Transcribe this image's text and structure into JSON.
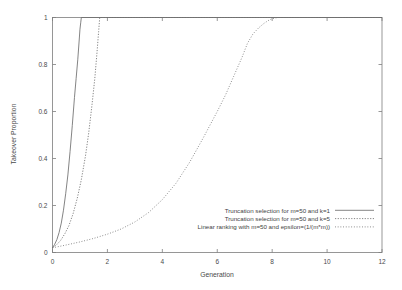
{
  "chart_data": {
    "type": "line",
    "title": "",
    "xlabel": "Generation",
    "ylabel": "Takeover Proportion",
    "xlim": [
      0,
      12
    ],
    "ylim": [
      0,
      1
    ],
    "xticks": [
      0,
      2,
      4,
      6,
      8,
      10,
      12
    ],
    "xtick_labels": [
      "0",
      "2",
      "4",
      "6",
      "8",
      "10",
      "12"
    ],
    "yticks": [
      0,
      0.2,
      0.4,
      0.6,
      0.8,
      1
    ],
    "ytick_labels": [
      "0",
      "0.2",
      "0.4",
      "0.6",
      "0.8",
      "1"
    ],
    "grid": false,
    "legend_position": "lower right",
    "series": [
      {
        "name": "Truncation selection for m=50 and k=1",
        "style": "solid",
        "color": "#6e6e6e",
        "x": [
          0,
          0.08,
          0.16,
          0.24,
          0.32,
          0.4,
          0.48,
          0.56,
          0.64,
          0.72,
          0.8,
          0.86,
          0.92,
          0.97,
          1.0,
          1.03,
          1.05,
          12
        ],
        "y": [
          0.02,
          0.035,
          0.055,
          0.085,
          0.125,
          0.18,
          0.25,
          0.33,
          0.43,
          0.54,
          0.66,
          0.74,
          0.82,
          0.9,
          0.95,
          0.98,
          1.0,
          1.0
        ]
      },
      {
        "name": "Truncation selection for m=50 and k=5",
        "style": "dashed",
        "color": "#6e6e6e",
        "x": [
          0,
          0.15,
          0.3,
          0.45,
          0.6,
          0.75,
          0.9,
          1.05,
          1.2,
          1.32,
          1.44,
          1.54,
          1.62,
          1.68,
          1.72,
          12
        ],
        "y": [
          0.02,
          0.033,
          0.052,
          0.08,
          0.115,
          0.165,
          0.23,
          0.31,
          0.41,
          0.51,
          0.63,
          0.74,
          0.85,
          0.94,
          1.0,
          1.0
        ]
      },
      {
        "name": "Linear ranking with m=50 and epsilon=(1/(m*m))",
        "style": "dotted",
        "color": "#8e8e8e",
        "x": [
          0,
          0.5,
          1.0,
          1.5,
          2.0,
          2.5,
          3.0,
          3.5,
          4.0,
          4.5,
          5.0,
          5.5,
          6.0,
          6.3,
          6.6,
          6.9,
          7.1,
          7.3,
          7.5,
          7.7,
          7.9,
          8.0,
          8.2,
          12
        ],
        "y": [
          0.02,
          0.032,
          0.045,
          0.06,
          0.078,
          0.1,
          0.13,
          0.17,
          0.225,
          0.295,
          0.385,
          0.49,
          0.6,
          0.67,
          0.75,
          0.83,
          0.89,
          0.93,
          0.955,
          0.975,
          0.99,
          0.995,
          1.0,
          1.0
        ]
      }
    ]
  },
  "legend": {
    "entries": [
      {
        "label": "Truncation selection for m=50 and k=1",
        "style": "solid"
      },
      {
        "label": "Truncation selection for m=50 and k=5",
        "style": "dashed"
      },
      {
        "label": "Linear ranking with m=50 and epsilon=(1/(m*m))",
        "style": "dotted"
      }
    ]
  },
  "axes": {
    "x_title": "Generation",
    "y_title": "Takeover Proportion"
  }
}
